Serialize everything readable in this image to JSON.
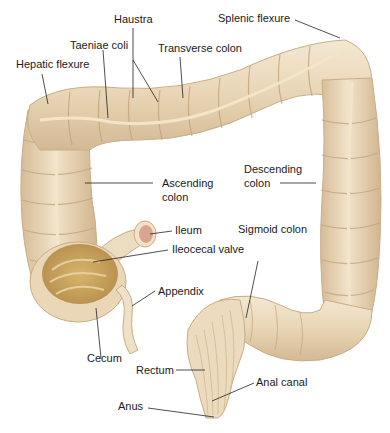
{
  "diagram": {
    "colors": {
      "tissue": "#ead9bd",
      "tissue_shadow": "#cdb28b",
      "tissue_highlight": "#f6ecda",
      "taenia": "#f3e6c8",
      "ileum_lumen": "#d9a58e",
      "cecum_interior": "#c9a25a",
      "leader_line": "#222222",
      "text": "#1a1a1a"
    },
    "labels": {
      "haustra": "Haustra",
      "taeniae_coli": "Taeniae coli",
      "transverse_colon": "Transverse colon",
      "splenic_flexure": "Splenic flexure",
      "hepatic_flexure": "Hepatic flexure",
      "ascending_colon_1": "Ascending",
      "ascending_colon_2": "colon",
      "descending_colon_1": "Descending",
      "descending_colon_2": "colon",
      "ileum": "Ileum",
      "ileocecal_valve": "Ileocecal valve",
      "sigmoid_colon": "Sigmoid colon",
      "appendix": "Appendix",
      "cecum": "Cecum",
      "rectum": "Rectum",
      "anal_canal": "Anal canal",
      "anus": "Anus"
    }
  }
}
